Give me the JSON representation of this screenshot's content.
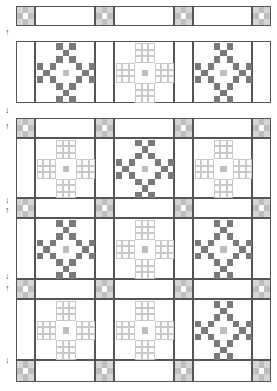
{
  "diagram": {
    "title": "",
    "colors": {
      "line": "#555555",
      "dark": "#7a7a7a",
      "light": "#cfcfcf",
      "grid_light": "#c8c8c8",
      "center": "#bdbdbd"
    },
    "columns": [
      16,
      35,
      95,
      114,
      174,
      193,
      252,
      271
    ],
    "strips": [
      {
        "y": 6,
        "h": 20
      },
      {
        "y": 118,
        "h": 20
      },
      {
        "y": 198,
        "h": 20
      },
      {
        "y": 279,
        "h": 20
      },
      {
        "y": 360,
        "h": 22
      }
    ],
    "block_rows": [
      {
        "y": 41,
        "h": 62,
        "blocks": [
          "dark",
          "light",
          "dark"
        ]
      },
      {
        "y": 138,
        "h": 60,
        "blocks": [
          "light",
          "dark",
          "light"
        ]
      },
      {
        "y": 218,
        "h": 61,
        "blocks": [
          "dark",
          "light",
          "dark"
        ]
      },
      {
        "y": 299,
        "h": 61,
        "blocks": [
          "light",
          "light",
          "dark"
        ]
      }
    ],
    "arrows": [
      {
        "y": 28,
        "dir": "up"
      },
      {
        "y": 106,
        "dir": "down"
      },
      {
        "y": 122,
        "dir": "up"
      },
      {
        "y": 196,
        "dir": "down"
      },
      {
        "y": 206,
        "dir": "up"
      },
      {
        "y": 272,
        "dir": "down"
      },
      {
        "y": 284,
        "dir": "up"
      },
      {
        "y": 356,
        "dir": "down"
      }
    ]
  }
}
